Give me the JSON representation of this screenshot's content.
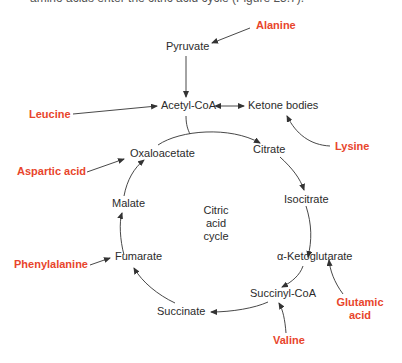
{
  "cut_text": "amino acids enter the citric acid cycle (Figure 25.7).",
  "center_label": [
    "Citric",
    "acid",
    "cycle"
  ],
  "intermediates": {
    "pyruvate": "Pyruvate",
    "acetyl_coa": "Acetyl-CoA",
    "ketone_bodies": "Ketone bodies",
    "citrate": "Citrate",
    "isocitrate": "Isocitrate",
    "alpha_ketoglutarate": "α-Ketoglutarate",
    "succinyl_coa": "Succinyl-CoA",
    "succinate": "Succinate",
    "fumarate": "Fumarate",
    "malate": "Malate",
    "oxaloacetate": "Oxaloacetate"
  },
  "amino_acids": {
    "alanine": "Alanine",
    "leucine": "Leucine",
    "lysine": "Lysine",
    "aspartic_acid": "Aspartic acid",
    "phenylalanine": "Phenylalanine",
    "glutamic_acid_1": "Glutamic",
    "glutamic_acid_2": "acid",
    "valine": "Valine"
  },
  "colors": {
    "amino_acid": "#e8452c",
    "text": "#2b2b2b",
    "arrow": "#333333"
  }
}
